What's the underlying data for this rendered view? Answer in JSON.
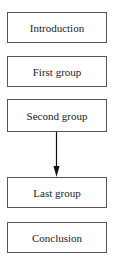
{
  "diagram": {
    "boxes": [
      {
        "id": "introduction",
        "label": "Introduction"
      },
      {
        "id": "first-group",
        "label": "First group"
      },
      {
        "id": "second-group",
        "label": "Second group"
      },
      {
        "id": "last-group",
        "label": "Last group"
      },
      {
        "id": "conclusion",
        "label": "Conclusion"
      }
    ],
    "edges": [
      {
        "from": "second-group",
        "to": "last-group",
        "type": "arrow"
      }
    ],
    "colors": {
      "border": "#555555",
      "text": "#1a1a1a",
      "background": "#ffffff"
    }
  }
}
